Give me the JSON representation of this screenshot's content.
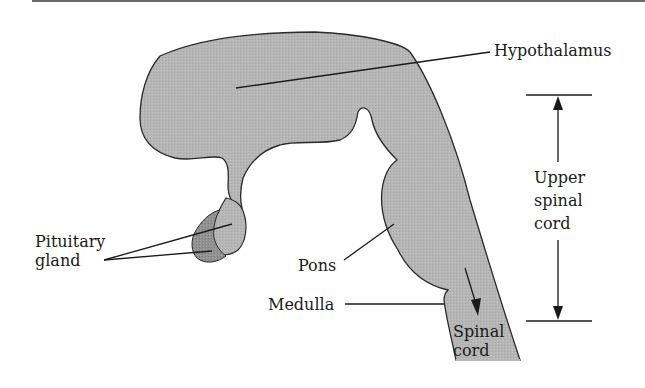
{
  "diagram": {
    "colors": {
      "tissue_fill": "#b4b4b4",
      "pituitary_fill": "#8e8e8e",
      "outline": "#2a2a2a",
      "label_text": "#1a1a1a",
      "background": "#ffffff"
    },
    "labels": {
      "hypothalamus": "Hypothalamus",
      "pituitary_line1": "Pituitary",
      "pituitary_line2": "gland",
      "pons": "Pons",
      "medulla": "Medulla",
      "spinal_line1": "Spinal",
      "spinal_line2": "cord",
      "upper_line1": "Upper",
      "upper_line2": "spinal",
      "upper_line3": "cord"
    }
  }
}
